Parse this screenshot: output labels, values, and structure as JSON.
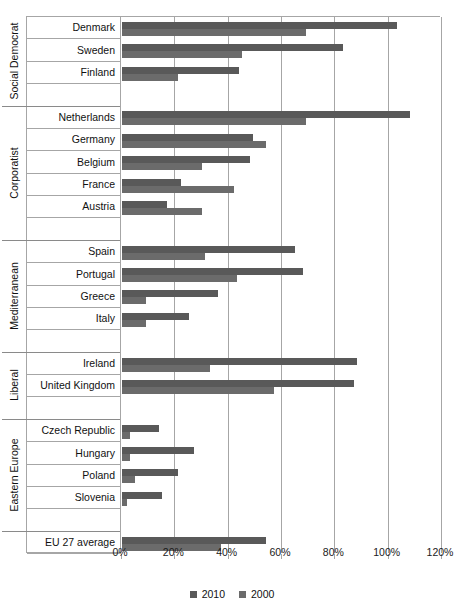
{
  "chart_data": {
    "type": "bar",
    "orientation": "horizontal",
    "title": "",
    "xlabel": "",
    "ylabel": "",
    "xlim": [
      0,
      120
    ],
    "xtick_labels": [
      "0%",
      "20%",
      "40%",
      "60%",
      "80%",
      "100%",
      "120%"
    ],
    "xticks": [
      0,
      20,
      40,
      60,
      80,
      100,
      120
    ],
    "grid": true,
    "legend_position": "bottom",
    "series": [
      {
        "name": "2010",
        "color": "#595959"
      },
      {
        "name": "2000",
        "color": "#6b6b6b"
      }
    ],
    "groups": [
      {
        "label": "Social Democrat",
        "categories": [
          "Denmark",
          "Sweden",
          "Finland"
        ],
        "values_2010": [
          103,
          83,
          44
        ],
        "values_2000": [
          69,
          45,
          21
        ]
      },
      {
        "label": "Corporatist",
        "categories": [
          "Netherlands",
          "Germany",
          "Belgium",
          "France",
          "Austria"
        ],
        "values_2010": [
          108,
          49,
          48,
          22,
          17
        ],
        "values_2000": [
          69,
          54,
          30,
          42,
          30
        ]
      },
      {
        "label": "Mediterranean",
        "categories": [
          "Spain",
          "Portugal",
          "Greece",
          "Italy"
        ],
        "values_2010": [
          65,
          68,
          36,
          25
        ],
        "values_2000": [
          31,
          43,
          9,
          9
        ]
      },
      {
        "label": "Liberal",
        "categories": [
          "Ireland",
          "United Kingdom"
        ],
        "values_2010": [
          88,
          87
        ],
        "values_2000": [
          33,
          57
        ]
      },
      {
        "label": "Eastern Europe",
        "categories": [
          "Czech Republic",
          "Hungary",
          "Poland",
          "Slovenia"
        ],
        "values_2010": [
          14,
          27,
          21,
          15
        ],
        "values_2000": [
          3,
          3,
          5,
          2
        ]
      },
      {
        "label": "",
        "categories": [
          "EU 27 average"
        ],
        "values_2010": [
          54
        ],
        "values_2000": [
          37
        ]
      }
    ]
  },
  "legend": {
    "items": [
      {
        "label": "2010"
      },
      {
        "label": "2000"
      }
    ]
  }
}
